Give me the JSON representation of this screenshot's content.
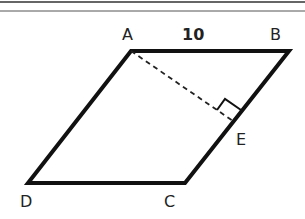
{
  "diagram": {
    "shape": "parallelogram",
    "vertices": {
      "A": {
        "label": "A",
        "x": 131,
        "y": 51
      },
      "B": {
        "label": "B",
        "x": 289,
        "y": 51
      },
      "C": {
        "label": "C",
        "x": 185,
        "y": 183
      },
      "D": {
        "label": "D",
        "x": 28,
        "y": 183
      },
      "E": {
        "label": "E",
        "x": 233,
        "y": 121
      }
    },
    "side_label": "10",
    "dashed_segment": "AE",
    "right_angle_at": "E",
    "colors": {
      "stroke": "#111111",
      "text": "#222222"
    }
  }
}
